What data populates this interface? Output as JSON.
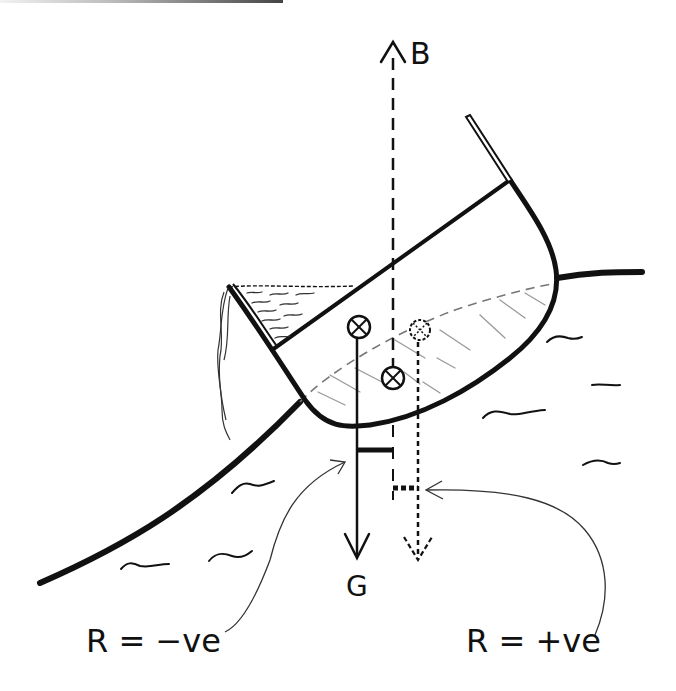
{
  "diagram": {
    "labels": {
      "buoyancy": "B",
      "gravity": "G",
      "righting_negative": "R = −ve",
      "righting_positive": "R = +ve"
    },
    "elements": [
      "wave-slope-surface",
      "boat-hull",
      "boat-deck-line",
      "bow-post",
      "water-in-boat",
      "spilling-water",
      "centre-of-gravity-marker",
      "centre-of-buoyancy-marker",
      "alt-centre-of-buoyancy-marker",
      "buoyancy-arrow",
      "gravity-arrow",
      "alt-buoyancy-arrow",
      "righting-arm-negative",
      "righting-arm-positive",
      "pointer-curve-negative",
      "pointer-curve-positive"
    ],
    "colors": {
      "ink": "#111111",
      "hatch": "#8a8a8a",
      "background": "#ffffff"
    }
  }
}
